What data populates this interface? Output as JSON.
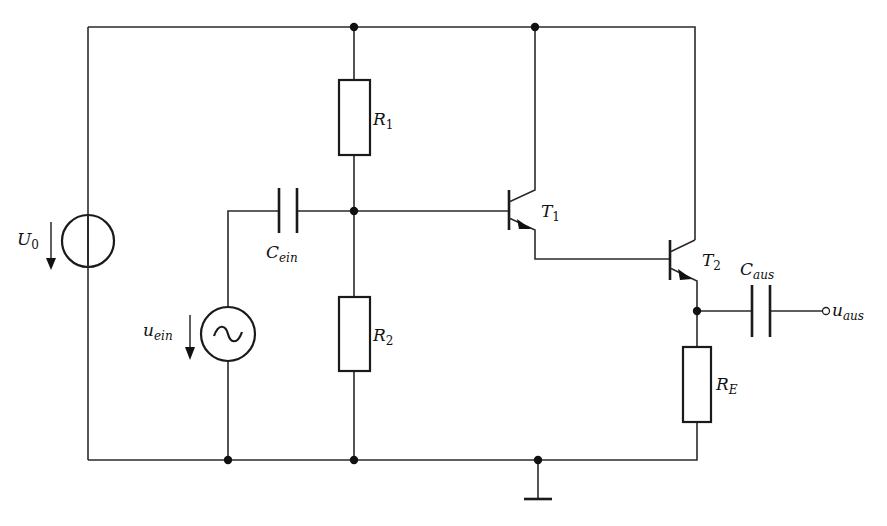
{
  "diagram": {
    "type": "circuit-schematic",
    "components": {
      "U0": {
        "main": "U",
        "sub": "0",
        "kind": "dc-voltage-source"
      },
      "uein": {
        "main": "u",
        "sub": "ein",
        "kind": "ac-voltage-source"
      },
      "Cein": {
        "main": "C",
        "sub": "ein",
        "kind": "capacitor"
      },
      "R1": {
        "main": "R",
        "sub": "1",
        "kind": "resistor"
      },
      "R2": {
        "main": "R",
        "sub": "2",
        "kind": "resistor"
      },
      "T1": {
        "main": "T",
        "sub": "1",
        "kind": "npn-transistor"
      },
      "T2": {
        "main": "T",
        "sub": "2",
        "kind": "npn-transistor"
      },
      "Caus": {
        "main": "C",
        "sub": "aus",
        "kind": "capacitor"
      },
      "RE": {
        "main": "R",
        "sub": "E",
        "kind": "resistor"
      },
      "uaus": {
        "main": "u",
        "sub": "aus",
        "kind": "output-terminal"
      },
      "ground": {
        "kind": "ground"
      }
    },
    "colors": {
      "line": "#2a2a2a",
      "background": "#ffffff"
    }
  }
}
